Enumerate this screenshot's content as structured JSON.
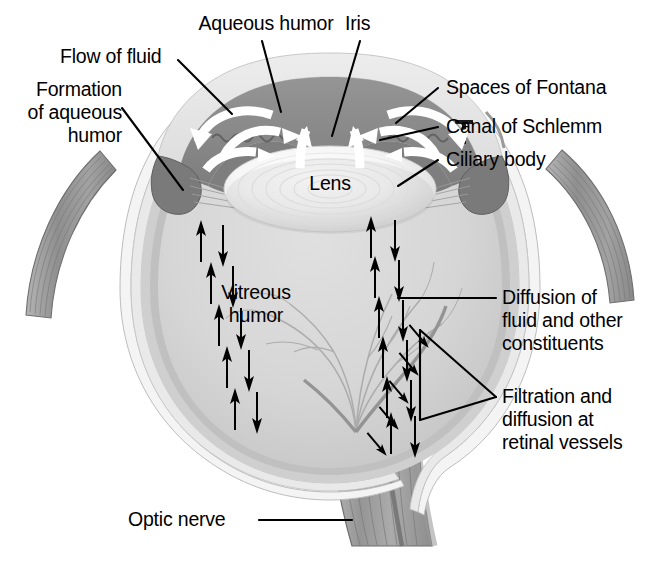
{
  "figure": {
    "colors": {
      "background": "#ffffff",
      "iris_anterior": "#8a8a8a",
      "vitreous": "#d8d8d8",
      "sclera_outer": "#f2f2f2",
      "sclera_mid": "#e4e4e4",
      "muscle": "#9a9a9a",
      "lens": "#fbfbfb",
      "flow_arrow": "#ffffff",
      "diffusion_arrow": "#000000",
      "leader_line": "#000000",
      "vessel": "#a8a8a8"
    }
  },
  "labels": {
    "aqueous_humor": "Aqueous humor",
    "iris": "Iris",
    "flow_of_fluid": "Flow of fluid",
    "formation_line1": "Formation",
    "formation_line2": "of aqueous",
    "formation_line3": "humor",
    "spaces_of_fontana": "Spaces of Fontana",
    "canal_of_schlemm": "Canal of Schlemm",
    "ciliary_body": "Ciliary body",
    "lens": "Lens",
    "vitreous_line1": "Vitreous",
    "vitreous_line2": "humor",
    "diffusion_line1": "Diffusion of",
    "diffusion_line2": "fluid and other",
    "diffusion_line3": "constituents",
    "filtration_line1": "Filtration and",
    "filtration_line2": "diffusion at",
    "filtration_line3": "retinal vessels",
    "optic_nerve": "Optic nerve"
  },
  "structures": [
    {
      "name": "cornea",
      "label": null
    },
    {
      "name": "anterior-chamber",
      "label": "Aqueous humor"
    },
    {
      "name": "iris",
      "label": "Iris"
    },
    {
      "name": "lens",
      "label": "Lens"
    },
    {
      "name": "ciliary-body",
      "label": "Ciliary body"
    },
    {
      "name": "canal-of-schlemm",
      "label": "Canal of Schlemm"
    },
    {
      "name": "spaces-of-fontana",
      "label": "Spaces of Fontana"
    },
    {
      "name": "vitreous-body",
      "label": "Vitreous humor"
    },
    {
      "name": "retina",
      "label": null
    },
    {
      "name": "choroid",
      "label": null
    },
    {
      "name": "sclera",
      "label": null
    },
    {
      "name": "retinal-vessels",
      "label": "Filtration and diffusion at retinal vessels"
    },
    {
      "name": "optic-nerve",
      "label": "Optic nerve"
    },
    {
      "name": "extraocular-muscle-left",
      "label": null
    },
    {
      "name": "extraocular-muscle-right",
      "label": null
    }
  ],
  "flow_arrows": {
    "description": "White curved arrows in the anterior chamber showing circulation of aqueous humor",
    "count": 6
  },
  "diffusion_arrows": {
    "description": "Black paired up/down arrows in vitreous humor showing diffusion of fluid",
    "left_column_pairs": 5,
    "right_column_pairs": 6,
    "retinal_vessel_arrows": 5
  }
}
